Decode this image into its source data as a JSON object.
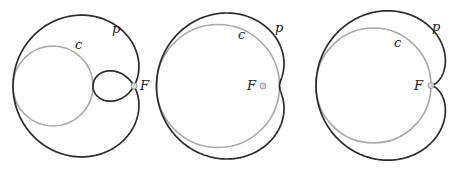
{
  "figure": {
    "width": 452,
    "height": 170,
    "colors": {
      "pedal_curve": "#2b2b2b",
      "circle": "#a8a8a8",
      "focus_fill": "#d8d8d8",
      "focus_stroke": "#9a9a9a",
      "label": "#222222"
    },
    "panels": [
      {
        "id": "inner-loop",
        "circle": {
          "label": "c",
          "cx": 53,
          "cy": 86,
          "r": 40
        },
        "focus": {
          "label": "F",
          "x": 134,
          "y": 86
        },
        "curve_label": "p",
        "labels": {
          "c": {
            "x": 75,
            "y": 49
          },
          "p": {
            "x": 112,
            "y": 33
          },
          "F": {
            "x": 140,
            "y": 90
          }
        }
      },
      {
        "id": "dimpled",
        "circle": {
          "label": "c",
          "cx": 218,
          "cy": 86,
          "r": 61.5
        },
        "focus": {
          "label": "F",
          "x": 263,
          "y": 86
        },
        "curve_label": "p",
        "labels": {
          "c": {
            "x": 238,
            "y": 39
          },
          "p": {
            "x": 275,
            "y": 32
          },
          "F": {
            "x": 247,
            "y": 90
          }
        }
      },
      {
        "id": "cardioid",
        "circle": {
          "label": "c",
          "cx": 373.5,
          "cy": 85.5,
          "r": 57.5
        },
        "focus": {
          "label": "F",
          "x": 431,
          "y": 85.5
        },
        "curve_label": "p",
        "labels": {
          "c": {
            "x": 394,
            "y": 47
          },
          "p": {
            "x": 432,
            "y": 31
          },
          "F": {
            "x": 414,
            "y": 90
          }
        }
      }
    ]
  }
}
